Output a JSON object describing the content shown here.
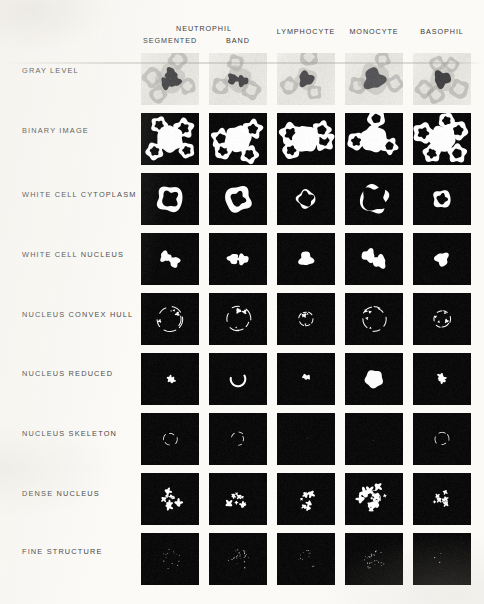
{
  "figure": {
    "background_color": "#fbfaf7",
    "binary_background_color": "#0b0b0b",
    "graylevel_background_color": "#e7e5e0",
    "foreground_color": "#ffffff"
  },
  "header": {
    "groups": [
      {
        "label": "NEUTROPHIL",
        "spans": [
          "SEGMENTED",
          "BAND"
        ]
      }
    ],
    "columns": [
      {
        "id": "segmented",
        "label": "SEGMENTED",
        "group": "NEUTROPHIL"
      },
      {
        "id": "band",
        "label": "BAND",
        "group": "NEUTROPHIL"
      },
      {
        "id": "lymphocyte",
        "label": "LYMPHOCYTE",
        "group": ""
      },
      {
        "id": "monocyte",
        "label": "MONOCYTE",
        "group": ""
      },
      {
        "id": "basophil",
        "label": "BASOPHIL",
        "group": ""
      }
    ]
  },
  "rows": [
    {
      "id": "gray-level",
      "label": "GRAY LEVEL"
    },
    {
      "id": "binary-image",
      "label": "BINARY IMAGE"
    },
    {
      "id": "white-cell-cytoplasm",
      "label": "WHITE CELL CYTOPLASM"
    },
    {
      "id": "white-cell-nucleus",
      "label": "WHITE CELL NUCLEUS"
    },
    {
      "id": "nucleus-convex-hull",
      "label": "NUCLEUS CONVEX HULL"
    },
    {
      "id": "nucleus-reduced",
      "label": "NUCLEUS REDUCED"
    },
    {
      "id": "nucleus-skeleton",
      "label": "NUCLEUS SKELETON"
    },
    {
      "id": "dense-nucleus",
      "label": "DENSE NUCLEUS"
    },
    {
      "id": "fine-structure",
      "label": "FINE STRUCTURE"
    }
  ],
  "layout": {
    "col_x": [
      141,
      209,
      277,
      345,
      413
    ],
    "row_y": [
      53,
      113,
      173,
      233,
      293,
      353,
      413,
      473,
      533
    ],
    "cell_w": 58,
    "cell_h": 52,
    "label_y": [
      66,
      126,
      190,
      250,
      310,
      369,
      429,
      489,
      547
    ]
  },
  "chart_data": {
    "type": "image-grid",
    "title": "",
    "columns": [
      "SEGMENTED",
      "BAND",
      "LYMPHOCYTE",
      "MONOCYTE",
      "BASOPHIL"
    ],
    "column_groups": [
      "NEUTROPHIL",
      "NEUTROPHIL",
      "",
      "",
      ""
    ],
    "rows": [
      "GRAY LEVEL",
      "BINARY IMAGE",
      "WHITE CELL CYTOPLASM",
      "WHITE CELL NUCLEUS",
      "NUCLEUS CONVEX HULL",
      "NUCLEUS REDUCED",
      "NUCLEUS SKELETON",
      "DENSE NUCLEUS",
      "FINE STRUCTURE"
    ],
    "cells": [
      {
        "row": "GRAY LEVEL",
        "col": "SEGMENTED",
        "kind": "gray",
        "nucleus_lobes": 3,
        "rbc_count": 4,
        "wbc_radius": 13,
        "nucleus_darkness": 0.86
      },
      {
        "row": "GRAY LEVEL",
        "col": "BAND",
        "kind": "gray",
        "nucleus_lobes": 2,
        "rbc_count": 3,
        "wbc_radius": 12,
        "nucleus_darkness": 0.84
      },
      {
        "row": "GRAY LEVEL",
        "col": "LYMPHOCYTE",
        "kind": "gray",
        "nucleus_lobes": 1,
        "rbc_count": 3,
        "wbc_radius": 10,
        "nucleus_darkness": 0.82
      },
      {
        "row": "GRAY LEVEL",
        "col": "MONOCYTE",
        "kind": "gray",
        "nucleus_lobes": 1,
        "rbc_count": 3,
        "wbc_radius": 14,
        "nucleus_darkness": 0.78
      },
      {
        "row": "GRAY LEVEL",
        "col": "BASOPHIL",
        "kind": "gray",
        "nucleus_lobes": 1,
        "rbc_count": 5,
        "wbc_radius": 11,
        "nucleus_darkness": 0.88
      },
      {
        "row": "BINARY IMAGE",
        "col": "SEGMENTED",
        "kind": "binary",
        "blobs": 4
      },
      {
        "row": "BINARY IMAGE",
        "col": "BAND",
        "kind": "binary",
        "blobs": 4
      },
      {
        "row": "BINARY IMAGE",
        "col": "LYMPHOCYTE",
        "kind": "binary",
        "blobs": 4
      },
      {
        "row": "BINARY IMAGE",
        "col": "MONOCYTE",
        "kind": "binary",
        "blobs": 3
      },
      {
        "row": "BINARY IMAGE",
        "col": "BASOPHIL",
        "kind": "binary",
        "blobs": 5
      },
      {
        "row": "WHITE CELL CYTOPLASM",
        "col": "SEGMENTED",
        "kind": "cytoplasm",
        "ring_r": 13,
        "thickness": 5
      },
      {
        "row": "WHITE CELL CYTOPLASM",
        "col": "BAND",
        "kind": "cytoplasm",
        "ring_r": 13,
        "thickness": 6
      },
      {
        "row": "WHITE CELL CYTOPLASM",
        "col": "LYMPHOCYTE",
        "kind": "cytoplasm",
        "ring_r": 9,
        "thickness": 2
      },
      {
        "row": "WHITE CELL CYTOPLASM",
        "col": "MONOCYTE",
        "kind": "cytoplasm",
        "ring_r": 14,
        "thickness": 2
      },
      {
        "row": "WHITE CELL CYTOPLASM",
        "col": "BASOPHIL",
        "kind": "cytoplasm",
        "ring_r": 9,
        "thickness": 4
      },
      {
        "row": "WHITE CELL NUCLEUS",
        "col": "SEGMENTED",
        "kind": "nucleus",
        "area": 0.62
      },
      {
        "row": "WHITE CELL NUCLEUS",
        "col": "BAND",
        "kind": "nucleus",
        "area": 0.58
      },
      {
        "row": "WHITE CELL NUCLEUS",
        "col": "LYMPHOCYTE",
        "kind": "nucleus",
        "area": 0.34
      },
      {
        "row": "WHITE CELL NUCLEUS",
        "col": "MONOCYTE",
        "kind": "nucleus",
        "area": 0.9
      },
      {
        "row": "WHITE CELL NUCLEUS",
        "col": "BASOPHIL",
        "kind": "nucleus",
        "area": 0.3
      },
      {
        "row": "NUCLEUS CONVEX HULL",
        "col": "SEGMENTED",
        "kind": "hull",
        "r": 12
      },
      {
        "row": "NUCLEUS CONVEX HULL",
        "col": "BAND",
        "kind": "hull",
        "r": 12
      },
      {
        "row": "NUCLEUS CONVEX HULL",
        "col": "LYMPHOCYTE",
        "kind": "hull",
        "r": 7
      },
      {
        "row": "NUCLEUS CONVEX HULL",
        "col": "MONOCYTE",
        "kind": "hull",
        "r": 12
      },
      {
        "row": "NUCLEUS CONVEX HULL",
        "col": "BASOPHIL",
        "kind": "hull",
        "r": 8
      },
      {
        "row": "NUCLEUS REDUCED",
        "col": "SEGMENTED",
        "kind": "reduced",
        "area": 0.18
      },
      {
        "row": "NUCLEUS REDUCED",
        "col": "BAND",
        "kind": "reduced",
        "area": 0.4
      },
      {
        "row": "NUCLEUS REDUCED",
        "col": "LYMPHOCYTE",
        "kind": "reduced",
        "area": 0.1
      },
      {
        "row": "NUCLEUS REDUCED",
        "col": "MONOCYTE",
        "kind": "reduced",
        "area": 0.55
      },
      {
        "row": "NUCLEUS REDUCED",
        "col": "BASOPHIL",
        "kind": "reduced",
        "area": 0.22
      },
      {
        "row": "NUCLEUS SKELETON",
        "col": "SEGMENTED",
        "kind": "skeleton",
        "present": true
      },
      {
        "row": "NUCLEUS SKELETON",
        "col": "BAND",
        "kind": "skeleton",
        "present": true
      },
      {
        "row": "NUCLEUS SKELETON",
        "col": "LYMPHOCYTE",
        "kind": "skeleton",
        "present": false
      },
      {
        "row": "NUCLEUS SKELETON",
        "col": "MONOCYTE",
        "kind": "skeleton",
        "present": false
      },
      {
        "row": "NUCLEUS SKELETON",
        "col": "BASOPHIL",
        "kind": "skeleton",
        "present": true
      },
      {
        "row": "DENSE NUCLEUS",
        "col": "SEGMENTED",
        "kind": "dense",
        "density": 0.45
      },
      {
        "row": "DENSE NUCLEUS",
        "col": "BAND",
        "kind": "dense",
        "density": 0.5
      },
      {
        "row": "DENSE NUCLEUS",
        "col": "LYMPHOCYTE",
        "kind": "dense",
        "density": 0.35
      },
      {
        "row": "DENSE NUCLEUS",
        "col": "MONOCYTE",
        "kind": "dense",
        "density": 0.85
      },
      {
        "row": "DENSE NUCLEUS",
        "col": "BASOPHIL",
        "kind": "dense",
        "density": 0.28
      },
      {
        "row": "FINE STRUCTURE",
        "col": "SEGMENTED",
        "kind": "fine",
        "speckles": 14
      },
      {
        "row": "FINE STRUCTURE",
        "col": "BAND",
        "kind": "fine",
        "speckles": 26
      },
      {
        "row": "FINE STRUCTURE",
        "col": "LYMPHOCYTE",
        "kind": "fine",
        "speckles": 12
      },
      {
        "row": "FINE STRUCTURE",
        "col": "MONOCYTE",
        "kind": "fine",
        "speckles": 30
      },
      {
        "row": "FINE STRUCTURE",
        "col": "BASOPHIL",
        "kind": "fine",
        "speckles": 3
      }
    ]
  }
}
